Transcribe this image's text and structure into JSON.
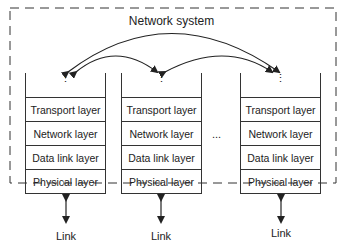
{
  "diagram": {
    "title": "Network system",
    "stacks": [
      {
        "id": "stack-1",
        "top_dots": "⋮",
        "layers": [
          "Transport layer",
          "Network layer",
          "Data link layer",
          "Physical layer"
        ],
        "link_label": "Link"
      },
      {
        "id": "stack-2",
        "top_dots": "⋮",
        "layers": [
          "Transport layer",
          "Network layer",
          "Data link layer",
          "Physical layer"
        ],
        "link_label": "Link"
      },
      {
        "id": "stack-3",
        "top_dots": "⋮",
        "layers": [
          "Transport layer",
          "Network layer",
          "Data link layer",
          "Physical layer"
        ],
        "link_label": "Link"
      }
    ],
    "between_ellipsis": "...",
    "connections": [
      {
        "from": "stack-1",
        "to": "stack-2",
        "type": "bidirectional-arc"
      },
      {
        "from": "stack-2",
        "to": "stack-3",
        "type": "bidirectional-arc"
      },
      {
        "from": "stack-1",
        "to": "stack-3",
        "type": "bidirectional-arc"
      }
    ]
  }
}
